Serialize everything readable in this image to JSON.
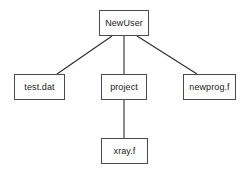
{
  "diagram": {
    "type": "tree",
    "canvas": {
      "width": 250,
      "height": 171,
      "background": "#ffffff"
    },
    "style": {
      "box_border_color": "#4a4a4a",
      "box_fill_color": "#ffffff",
      "edge_color": "#2b2b2b",
      "text_color": "#1a1a1a"
    },
    "nodes": [
      {
        "id": "newuser",
        "label": "NewUser",
        "kind": "directory",
        "level": 0,
        "x": 99,
        "y": 10,
        "width": 50,
        "height": 26
      },
      {
        "id": "testdat",
        "label": "test.dat",
        "kind": "file",
        "level": 1,
        "x": 14,
        "y": 74,
        "width": 51,
        "height": 26
      },
      {
        "id": "project",
        "label": "project",
        "kind": "directory",
        "level": 1,
        "x": 101,
        "y": 74,
        "width": 46,
        "height": 26
      },
      {
        "id": "newprogf",
        "label": "newprog.f",
        "kind": "file",
        "level": 1,
        "x": 183,
        "y": 74,
        "width": 53,
        "height": 26
      },
      {
        "id": "xrayf",
        "label": "xray.f",
        "kind": "file",
        "level": 2,
        "x": 101,
        "y": 138,
        "width": 47,
        "height": 26
      }
    ],
    "edges": [
      {
        "id": "edge-newuser-testdat",
        "from": "newuser",
        "to": "testdat",
        "x1": 112,
        "y1": 36,
        "x2": 57,
        "y2": 74
      },
      {
        "id": "edge-newuser-project",
        "from": "newuser",
        "to": "project",
        "x1": 124,
        "y1": 36,
        "x2": 124,
        "y2": 74
      },
      {
        "id": "edge-newuser-newprogf",
        "from": "newuser",
        "to": "newprogf",
        "x1": 137,
        "y1": 36,
        "x2": 197,
        "y2": 74
      },
      {
        "id": "edge-project-xrayf",
        "from": "project",
        "to": "xrayf",
        "x1": 124,
        "y1": 100,
        "x2": 124,
        "y2": 138
      }
    ]
  }
}
